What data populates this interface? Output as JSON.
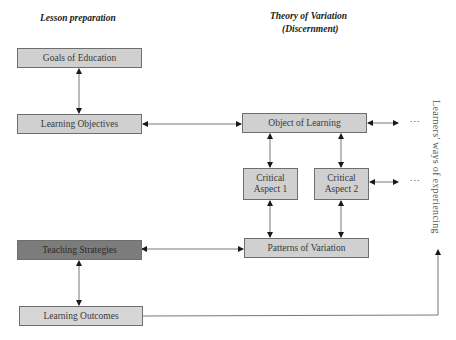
{
  "headings": {
    "left": "Lesson preparation",
    "right": "Theory of Variation",
    "right_sub": "(Discernment)"
  },
  "boxes": {
    "goals": "Goals of Education",
    "objectives": "Learning Objectives",
    "strategies": "Teaching Strategies",
    "outcomes": "Learning Outcomes",
    "object": "Object of Learning",
    "critical_aspect_1": "Critical Aspect 1",
    "critical_aspect_2": "Critical Aspect 2",
    "patterns": "Patterns of Variation"
  },
  "ellipses": [
    "...",
    "..."
  ],
  "side_label": "Learners' ways of experiencing",
  "colors": {
    "box_fill": "#d0d0d0",
    "highlight_fill": "#7c7c7c",
    "border": "#6e6e6e",
    "line": "#555555",
    "arrow": "#1a1a1a"
  }
}
